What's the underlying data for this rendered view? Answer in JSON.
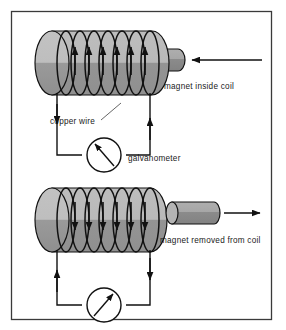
{
  "figure": {
    "border_color": "#3a3a3a",
    "background_color": "#ffffff"
  },
  "colors": {
    "coil_light": "#b9b9b9",
    "coil_dark": "#959595",
    "magnet_light": "#a8a8a8",
    "magnet_dark": "#8a8a8a",
    "line": "#111111",
    "text": "#1a1a1a"
  },
  "panels": [
    {
      "id": "top-panel",
      "name": "magnet-inserted-panel",
      "magnet_label": "magnet inside coil",
      "wire_label": "copper wire",
      "meter_label": "galvanometer",
      "magnet_position": "inside",
      "magnet_motion": "left",
      "coil_arrow_direction": "up",
      "left_wire_arrow": "down",
      "right_wire_arrow": "up",
      "needle_direction": "up-left",
      "turns": 7
    },
    {
      "id": "bottom-panel",
      "name": "magnet-removed-panel",
      "magnet_label": "magnet removed from coil",
      "wire_label": "",
      "meter_label": "",
      "magnet_position": "outside",
      "magnet_motion": "right",
      "coil_arrow_direction": "down",
      "left_wire_arrow": "up",
      "right_wire_arrow": "down",
      "needle_direction": "up-right",
      "turns": 7
    }
  ],
  "labels": {
    "magnet_inside_coil": "magnet inside coil",
    "copper_wire": "copper wire",
    "galvanometer": "galvanometer",
    "magnet_removed_from_coil": "magnet removed from coil"
  }
}
